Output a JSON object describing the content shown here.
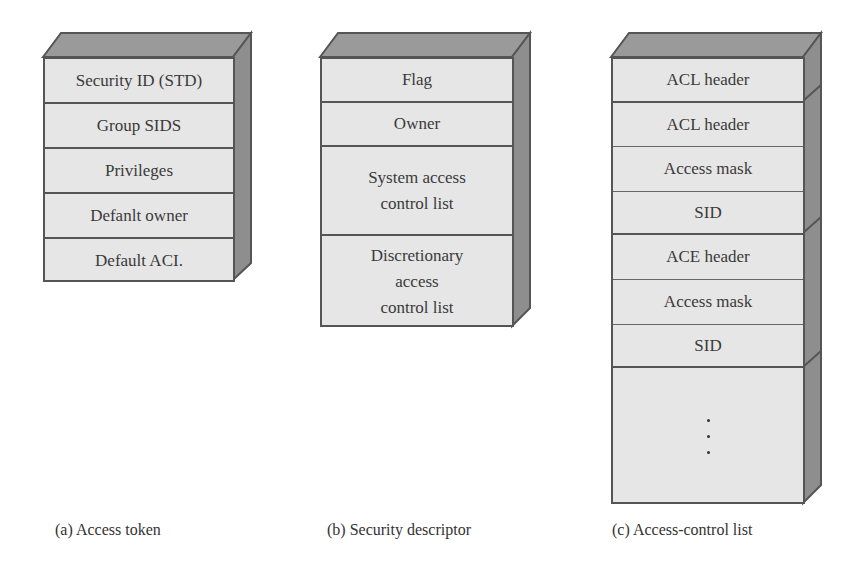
{
  "diagram": {
    "colors": {
      "front_fill": "#e6e6e6",
      "top_fill": "#9a9a9a",
      "side_fill": "#8e8e8e",
      "outline": "#555555"
    },
    "access_token": {
      "caption": "(a) Access token",
      "fields": [
        "Security ID (STD)",
        "Group SIDS",
        "Privileges",
        "Defanlt owner",
        "Default ACI."
      ]
    },
    "security_descriptor": {
      "caption": "(b) Security descriptor",
      "fields": [
        "Flag",
        "Owner",
        "System access control list",
        "Discretionary access control list"
      ],
      "lines": {
        "system": [
          "System access",
          "control list"
        ],
        "discretionary": [
          "Discretionary",
          "access",
          "control list"
        ]
      }
    },
    "access_control_list": {
      "caption": "(c) Access-control list",
      "fields": [
        "ACL header",
        "ACL header",
        "Access mask",
        "SID",
        "ACE header",
        "Access mask",
        "SID"
      ],
      "continuation": "⋮"
    }
  }
}
